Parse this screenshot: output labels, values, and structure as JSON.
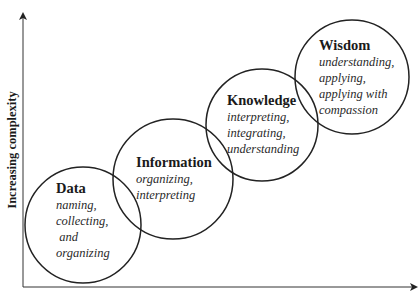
{
  "diagram": {
    "y_axis_label": "Increasing complexity",
    "x_axis_label": "",
    "stages": [
      {
        "title": "Data",
        "description": "naming,\ncollecting,\n and\norganizing"
      },
      {
        "title": "Information",
        "description": "organizing,\ninterpreting"
      },
      {
        "title": "Knowledge",
        "description": "interpreting,\nintegrating,\nunderstanding"
      },
      {
        "title": "Wisdom",
        "description": "understanding,\napplying,\napplying with\ncompassion"
      }
    ],
    "colors": {
      "line": "#222222",
      "background": "#ffffff"
    }
  }
}
